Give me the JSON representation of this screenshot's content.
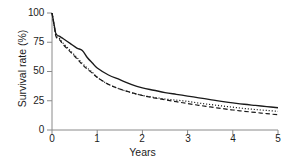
{
  "chart_data": {
    "type": "line",
    "title": "",
    "subtitle": "",
    "xlabel": "Years",
    "ylabel": "Survival rate (%)",
    "xlim": [
      0,
      5
    ],
    "ylim": [
      0,
      100
    ],
    "xticks": [
      "0",
      "1",
      "2",
      "3",
      "4",
      "5"
    ],
    "yticks": [
      "0",
      "25",
      "50",
      "75",
      "100"
    ],
    "grid": false,
    "legend": "none",
    "x": [
      0,
      0.08,
      0.17,
      0.25,
      0.4,
      0.55,
      0.67,
      0.78,
      0.9,
      1.0,
      1.25,
      1.5,
      1.75,
      2.0,
      2.25,
      2.5,
      2.75,
      3.0,
      3.25,
      3.5,
      3.75,
      4.0,
      4.25,
      4.5,
      4.75,
      5.0
    ],
    "series": [
      {
        "name": "solid-curve",
        "style": "solid",
        "color": "#1a1a1a",
        "values": [
          100,
          83,
          80,
          78,
          74,
          70,
          68,
          62,
          57,
          53,
          47,
          43,
          39,
          36,
          34,
          32,
          30.5,
          29,
          27.5,
          26,
          24.5,
          23.2,
          22,
          21,
          20,
          19
        ]
      },
      {
        "name": "dotted-curve",
        "style": "dotted",
        "color": "#1a1a1a",
        "values": [
          100,
          82,
          78,
          74,
          68,
          62,
          57,
          53,
          49,
          45,
          39,
          35,
          32,
          29.5,
          28,
          26.5,
          25.5,
          24.5,
          23,
          21.8,
          20.6,
          19.5,
          18.4,
          17.5,
          16.7,
          16
        ]
      },
      {
        "name": "dashed-curve",
        "style": "dashed",
        "color": "#1a1a1a",
        "values": [
          100,
          81,
          77,
          73,
          67,
          61,
          56,
          52,
          48.5,
          45,
          39,
          35,
          32,
          29.5,
          27.5,
          25.8,
          24.2,
          22.6,
          21.1,
          19.7,
          18.4,
          17.1,
          16,
          15,
          14,
          13
        ]
      }
    ],
    "axis_color": "#7a7a7a"
  },
  "axes": {
    "ylabel": "Survival rate (%)",
    "xlabel": "Years",
    "ytick_labels": [
      "100",
      "75",
      "50",
      "25",
      "0"
    ],
    "xtick_labels": [
      "0",
      "1",
      "2",
      "3",
      "4",
      "5"
    ]
  }
}
